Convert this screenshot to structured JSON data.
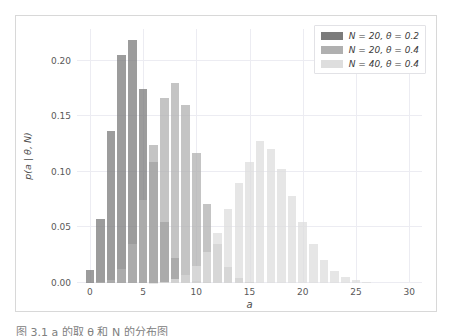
{
  "figure": {
    "background": "#ffffff",
    "frame_color": "#d8d8d8"
  },
  "caption": {
    "text": "图 3.1 a 的取 θ 和 N 的分布图"
  },
  "legend": {
    "position": "upper-right",
    "entries": [
      {
        "label": "N = 20, θ = 0.2",
        "color": "#7b7b7b"
      },
      {
        "label": "N = 20, θ = 0.4",
        "color": "#b0b0b0"
      },
      {
        "label": "N = 40, θ = 0.4",
        "color": "#dedede"
      }
    ]
  },
  "axis": {
    "xlabel": "a",
    "ylabel": "p(a | θ, N)",
    "xticks": [
      "0",
      "5",
      "10",
      "15",
      "20",
      "25",
      "30"
    ],
    "xtick_values": [
      0,
      5,
      10,
      15,
      20,
      25,
      30
    ],
    "yticks": [
      "0.00",
      "0.05",
      "0.10",
      "0.15",
      "0.20"
    ],
    "ytick_values": [
      0.0,
      0.05,
      0.1,
      0.15,
      0.2
    ],
    "xlim": [
      -1.2,
      31.2
    ],
    "ylim": [
      0.0,
      0.2285
    ],
    "grid": true
  },
  "chart_data": {
    "type": "bar",
    "title": "",
    "xlabel": "a",
    "ylabel": "p(a | θ, N)",
    "xlim": [
      -1.2,
      31.2
    ],
    "ylim": [
      0.0,
      0.2285
    ],
    "grid": true,
    "legend_position": "upper-right",
    "bar_alpha": 0.75,
    "x": [
      0,
      1,
      2,
      3,
      4,
      5,
      6,
      7,
      8,
      9,
      10,
      11,
      12,
      13,
      14,
      15,
      16,
      17,
      18,
      19,
      20,
      21,
      22,
      23,
      24,
      25,
      26,
      27,
      28,
      29,
      30
    ],
    "series": [
      {
        "name": "N = 20, θ = 0.2",
        "color": "#7b7b7b",
        "values": [
          0.0115,
          0.0576,
          0.1369,
          0.2054,
          0.2182,
          0.1746,
          0.1091,
          0.0545,
          0.0222,
          0.0074,
          0.002,
          0.0005,
          0.0001,
          0.0,
          0.0,
          0.0,
          0.0,
          0.0,
          0.0,
          0.0,
          0.0,
          0.0,
          0.0,
          0.0,
          0.0,
          0.0,
          0.0,
          0.0,
          0.0,
          0.0,
          0.0
        ]
      },
      {
        "name": "N = 20, θ = 0.4",
        "color": "#b0b0b0",
        "values": [
          0.0,
          0.0005,
          0.0031,
          0.0123,
          0.035,
          0.0746,
          0.1244,
          0.166,
          0.1797,
          0.1597,
          0.1171,
          0.071,
          0.0355,
          0.0146,
          0.0049,
          0.0013,
          0.0003,
          0.0,
          0.0,
          0.0,
          0.0,
          0.0,
          0.0,
          0.0,
          0.0,
          0.0,
          0.0,
          0.0,
          0.0,
          0.0,
          0.0
        ]
      },
      {
        "name": "N = 40, θ = 0.4",
        "color": "#dedede",
        "values": [
          0.0,
          0.0,
          0.0,
          0.0,
          0.0,
          0.0001,
          0.0004,
          0.0012,
          0.0032,
          0.0074,
          0.0151,
          0.0275,
          0.0451,
          0.0669,
          0.0898,
          0.1092,
          0.1279,
          0.1204,
          0.1023,
          0.0784,
          0.0548,
          0.0349,
          0.0203,
          0.0108,
          0.0052,
          0.0023,
          0.0009,
          0.0003,
          0.0001,
          0.0,
          0.0
        ]
      }
    ]
  }
}
